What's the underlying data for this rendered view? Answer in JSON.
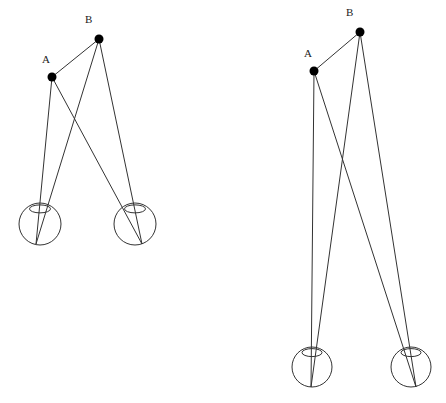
{
  "diagrams": [
    {
      "name": "near",
      "labels": {
        "a": "A",
        "b": "B"
      },
      "point_a": [
        52,
        77
      ],
      "point_b": [
        99,
        39
      ],
      "left_eye": {
        "cx": 40,
        "cy": 224,
        "r": 21,
        "bottom": [
          36,
          244
        ],
        "lens": [
          42,
          209
        ]
      },
      "right_eye": {
        "cx": 135,
        "cy": 224,
        "r": 21,
        "bottom": [
          142,
          244
        ],
        "lens": [
          131,
          209
        ]
      }
    },
    {
      "name": "far",
      "labels": {
        "a": "A",
        "b": "B"
      },
      "point_a": [
        314,
        71
      ],
      "point_b": [
        360,
        32
      ],
      "left_eye": {
        "cx": 312,
        "cy": 367,
        "r": 20,
        "bottom": [
          311,
          387
        ],
        "lens": [
          316,
          351
        ]
      },
      "right_eye": {
        "cx": 411,
        "cy": 367,
        "r": 20,
        "bottom": [
          416,
          387
        ],
        "lens": [
          407,
          351
        ]
      }
    }
  ]
}
